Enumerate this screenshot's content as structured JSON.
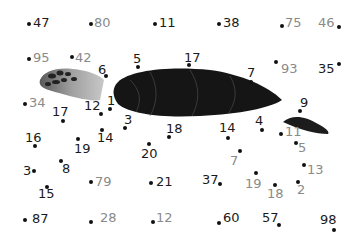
{
  "puzzle": {
    "type": "connect-the-dots",
    "subject": "sea turtle",
    "colors": {
      "primary_number": "#1a1a1a",
      "decoy_number": "#8a8a8a",
      "dot": "#111111",
      "turtle_shell": "#151515",
      "turtle_head": "#9a9a9a"
    },
    "points": [
      {
        "n": "47",
        "dx": 29,
        "dy": 24,
        "lx": 33,
        "ly": 16,
        "style": "primary"
      },
      {
        "n": "80",
        "dx": 91,
        "dy": 24,
        "lx": 94,
        "ly": 16,
        "style": "decoy"
      },
      {
        "n": "11",
        "dx": 155,
        "dy": 24,
        "lx": 159,
        "ly": 16,
        "style": "primary"
      },
      {
        "n": "38",
        "dx": 219,
        "dy": 24,
        "lx": 223,
        "ly": 16,
        "style": "primary"
      },
      {
        "n": "75",
        "dx": 282,
        "dy": 26,
        "lx": 285,
        "ly": 16,
        "style": "decoy"
      },
      {
        "n": "46",
        "dx": 339,
        "dy": 27,
        "lx": 318,
        "ly": 16,
        "style": "decoy"
      },
      {
        "n": "95",
        "dx": 29,
        "dy": 59,
        "lx": 33,
        "ly": 51,
        "style": "decoy"
      },
      {
        "n": "42",
        "dx": 72,
        "dy": 57,
        "lx": 75,
        "ly": 51,
        "style": "decoy"
      },
      {
        "n": "6",
        "dx": 106,
        "dy": 76,
        "lx": 98,
        "ly": 63,
        "style": "primary"
      },
      {
        "n": "5",
        "dx": 138,
        "dy": 67,
        "lx": 133,
        "ly": 52,
        "style": "primary"
      },
      {
        "n": "17",
        "dx": 189,
        "dy": 65,
        "lx": 184,
        "ly": 51,
        "style": "primary"
      },
      {
        "n": "7",
        "dx": 251,
        "dy": 82,
        "lx": 247,
        "ly": 66,
        "style": "primary"
      },
      {
        "n": "93",
        "dx": 276,
        "dy": 62,
        "lx": 281,
        "ly": 62,
        "style": "decoy"
      },
      {
        "n": "35",
        "dx": 339,
        "dy": 64,
        "lx": 318,
        "ly": 62,
        "style": "primary"
      },
      {
        "n": "34",
        "dx": 25,
        "dy": 104,
        "lx": 29,
        "ly": 96,
        "style": "decoy"
      },
      {
        "n": "17",
        "dx": 63,
        "dy": 121,
        "lx": 52,
        "ly": 105,
        "style": "primary"
      },
      {
        "n": "12",
        "dx": 101,
        "dy": 114,
        "lx": 84,
        "ly": 99,
        "style": "primary"
      },
      {
        "n": "1",
        "dx": 110,
        "dy": 109,
        "lx": 107,
        "ly": 94,
        "style": "primary"
      },
      {
        "n": "3",
        "dx": 125,
        "dy": 128,
        "lx": 124,
        "ly": 113,
        "style": "primary"
      },
      {
        "n": "18",
        "dx": 169,
        "dy": 137,
        "lx": 166,
        "ly": 122,
        "style": "primary"
      },
      {
        "n": "14",
        "dx": 228,
        "dy": 138,
        "lx": 219,
        "ly": 121,
        "style": "primary"
      },
      {
        "n": "4",
        "dx": 262,
        "dy": 130,
        "lx": 255,
        "ly": 114,
        "style": "primary"
      },
      {
        "n": "9",
        "dx": 300,
        "dy": 111,
        "lx": 300,
        "ly": 96,
        "style": "primary"
      },
      {
        "n": "11",
        "dx": 281,
        "dy": 134,
        "lx": 285,
        "ly": 125,
        "style": "decoy"
      },
      {
        "n": "16",
        "dx": 35,
        "dy": 146,
        "lx": 25,
        "ly": 131,
        "style": "primary"
      },
      {
        "n": "19",
        "dx": 78,
        "dy": 139,
        "lx": 74,
        "ly": 142,
        "style": "primary"
      },
      {
        "n": "14",
        "dx": 102,
        "dy": 130,
        "lx": 97,
        "ly": 131,
        "style": "primary"
      },
      {
        "n": "20",
        "dx": 149,
        "dy": 144,
        "lx": 141,
        "ly": 147,
        "style": "primary"
      },
      {
        "n": "5",
        "dx": 296,
        "dy": 143,
        "lx": 298,
        "ly": 141,
        "style": "decoy"
      },
      {
        "n": "7",
        "dx": 240,
        "dy": 151,
        "lx": 230,
        "ly": 154,
        "style": "decoy"
      },
      {
        "n": "3",
        "dx": 34,
        "dy": 171,
        "lx": 23,
        "ly": 164,
        "style": "primary"
      },
      {
        "n": "8",
        "dx": 61,
        "dy": 161,
        "lx": 62,
        "ly": 162,
        "style": "primary"
      },
      {
        "n": "15",
        "dx": 47,
        "dy": 187,
        "lx": 38,
        "ly": 187,
        "style": "primary"
      },
      {
        "n": "79",
        "dx": 91,
        "dy": 182,
        "lx": 95,
        "ly": 175,
        "style": "decoy"
      },
      {
        "n": "21",
        "dx": 151,
        "dy": 183,
        "lx": 156,
        "ly": 175,
        "style": "primary"
      },
      {
        "n": "13",
        "dx": 304,
        "dy": 165,
        "lx": 307,
        "ly": 163,
        "style": "decoy"
      },
      {
        "n": "37",
        "dx": 220,
        "dy": 184,
        "lx": 202,
        "ly": 173,
        "style": "primary"
      },
      {
        "n": "19",
        "dx": 256,
        "dy": 173,
        "lx": 245,
        "ly": 177,
        "style": "decoy"
      },
      {
        "n": "18",
        "dx": 275,
        "dy": 185,
        "lx": 267,
        "ly": 187,
        "style": "decoy"
      },
      {
        "n": "2",
        "dx": 298,
        "dy": 182,
        "lx": 297,
        "ly": 183,
        "style": "decoy"
      },
      {
        "n": "87",
        "dx": 25,
        "dy": 220,
        "lx": 32,
        "ly": 212,
        "style": "primary"
      },
      {
        "n": "28",
        "dx": 91,
        "dy": 222,
        "lx": 100,
        "ly": 211,
        "style": "decoy"
      },
      {
        "n": "12",
        "dx": 153,
        "dy": 222,
        "lx": 156,
        "ly": 211,
        "style": "decoy"
      },
      {
        "n": "60",
        "dx": 219,
        "dy": 223,
        "lx": 223,
        "ly": 211,
        "style": "primary"
      },
      {
        "n": "57",
        "dx": 279,
        "dy": 225,
        "lx": 262,
        "ly": 211,
        "style": "primary"
      },
      {
        "n": "98",
        "dx": 334,
        "dy": 230,
        "lx": 320,
        "ly": 213,
        "style": "primary"
      }
    ]
  }
}
